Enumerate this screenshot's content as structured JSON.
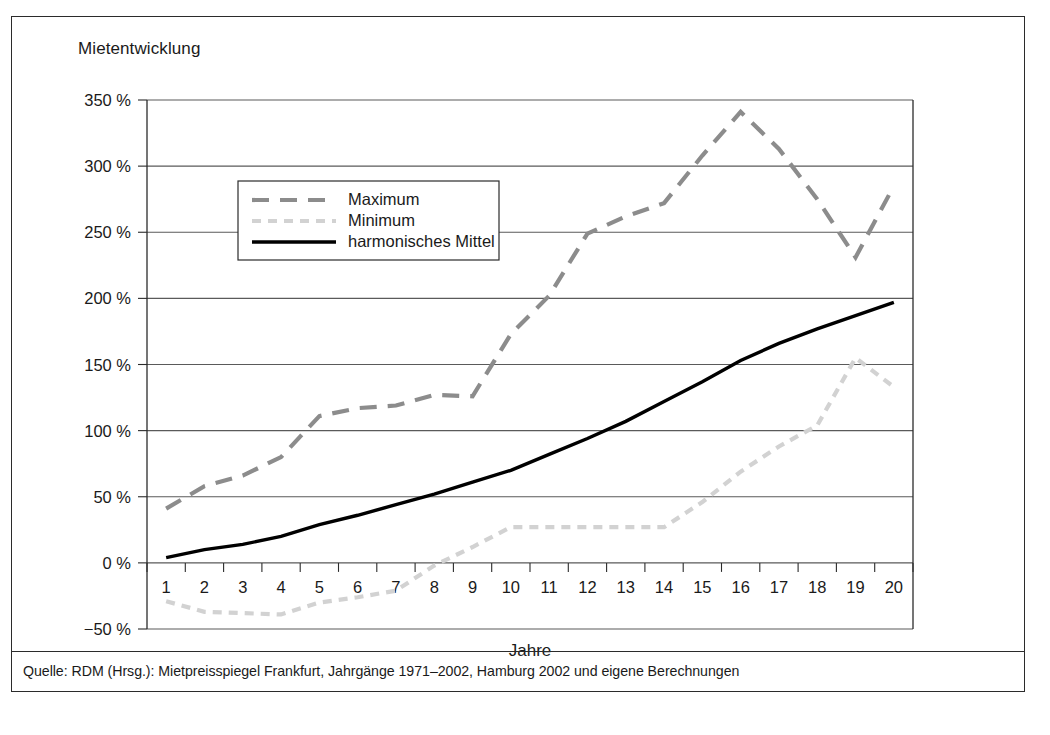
{
  "figure": {
    "title": "Mietentwicklung",
    "source_note": "Quelle: RDM (Hrsg.): Mietpreisspiegel Frankfurt, Jahrgänge 1971–2002, Hamburg 2002 und eigene Berechnungen"
  },
  "colors": {
    "maximum": "#8c8c8c",
    "minimum": "#d2d2d2",
    "mean": "#000000",
    "grid": "#5a5a5a",
    "axis": "#2b2b2b",
    "text": "#1a1a1a",
    "background": "#ffffff"
  },
  "chart_data": {
    "type": "line",
    "title": "Mietentwicklung",
    "xlabel": "Jahre",
    "ylabel": "",
    "categories": [
      "1",
      "2",
      "3",
      "4",
      "5",
      "6",
      "7",
      "8",
      "9",
      "10",
      "11",
      "12",
      "13",
      "14",
      "15",
      "16",
      "17",
      "18",
      "19",
      "20"
    ],
    "ytick_labels": [
      "350 %",
      "300 %",
      "250 %",
      "200 %",
      "150 %",
      "100 %",
      "50 %",
      "0 %",
      "−50 %"
    ],
    "ytick_values": [
      350,
      300,
      250,
      200,
      150,
      100,
      50,
      0,
      -50
    ],
    "ylim": [
      -50,
      350
    ],
    "grid": true,
    "legend_position": "upper-left-inside",
    "series": [
      {
        "name": "Maximum",
        "style": "dashed",
        "color": "#8c8c8c",
        "values": [
          41,
          58,
          66,
          80,
          111,
          117,
          119,
          127,
          126,
          173,
          202,
          249,
          262,
          272,
          308,
          341,
          313,
          275,
          231,
          285
        ]
      },
      {
        "name": "Minimum",
        "style": "dotted-dashed",
        "color": "#d2d2d2",
        "values": [
          -29,
          -37,
          -38,
          -39,
          -30,
          -26,
          -21,
          -2,
          12,
          27,
          27,
          27,
          27,
          27,
          46,
          69,
          88,
          104,
          155,
          133
        ]
      },
      {
        "name": "harmonisches Mittel",
        "style": "solid",
        "color": "#000000",
        "values": [
          4,
          10,
          14,
          20,
          29,
          36,
          44,
          52,
          61,
          70,
          82,
          94,
          107,
          122,
          137,
          153,
          166,
          177,
          187,
          197
        ]
      }
    ]
  },
  "legend": {
    "items": [
      {
        "label": "Maximum"
      },
      {
        "label": "Minimum"
      },
      {
        "label": "harmonisches Mittel"
      }
    ]
  }
}
